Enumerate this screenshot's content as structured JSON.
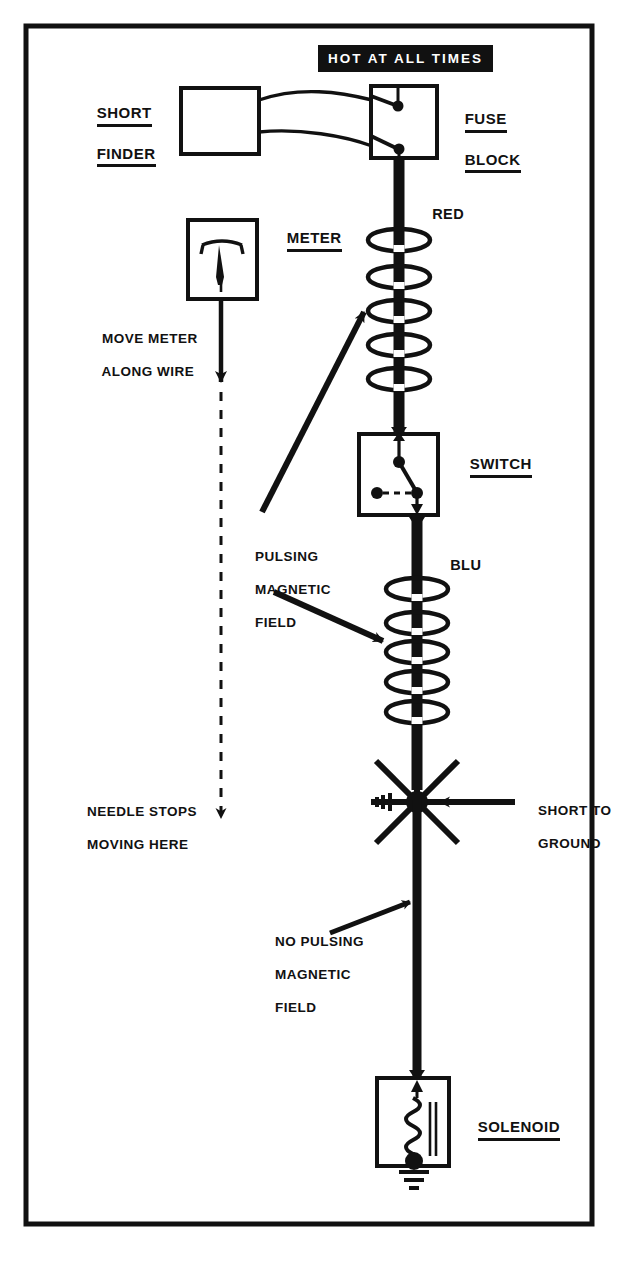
{
  "diagram": {
    "title_banner": "HOT AT ALL TIMES",
    "components": {
      "short_finder": {
        "label_line1": "SHORT",
        "label_line2": "FINDER",
        "name": "short-finder"
      },
      "fuse_block": {
        "label_line1": "FUSE",
        "label_line2": "BLOCK",
        "name": "fuse-block"
      },
      "meter": {
        "label": "METER",
        "name": "meter"
      },
      "switch": {
        "label": "SWITCH",
        "name": "switch"
      },
      "solenoid": {
        "label": "SOLENOID",
        "name": "solenoid"
      }
    },
    "wires": [
      {
        "id": "red",
        "label": "RED",
        "color_name": "RED",
        "from": "fuse-block",
        "to": "switch"
      },
      {
        "id": "blu",
        "label": "BLU",
        "color_name": "BLU",
        "from": "switch",
        "to": "solenoid"
      }
    ],
    "annotations": {
      "move_meter": {
        "line1": "MOVE METER",
        "line2": "ALONG WIRE"
      },
      "pulsing": {
        "line1": "PULSING",
        "line2": "MAGNETIC",
        "line3": "FIELD"
      },
      "needle_stops": {
        "line1": "NEEDLE STOPS",
        "line2": "MOVING HERE"
      },
      "no_pulsing": {
        "line1": "NO PULSING",
        "line2": "MAGNETIC",
        "line3": "FIELD"
      },
      "short_ground": {
        "line1": "SHORT TO",
        "line2": "GROUND"
      }
    },
    "field_rings": {
      "upper_group_count": 5,
      "lower_group_count": 5,
      "meaning": "pulsing-magnetic-field"
    },
    "icons": {
      "short_burst": "short-to-ground-starburst-icon",
      "ground_symbol": "chassis-ground-icon",
      "coil": "solenoid-coil-icon",
      "needle": "meter-needle-icon"
    },
    "colors": {
      "ink": "#111111",
      "paper": "#ffffff",
      "banner_bg": "#111111",
      "banner_fg": "#ffffff"
    }
  }
}
